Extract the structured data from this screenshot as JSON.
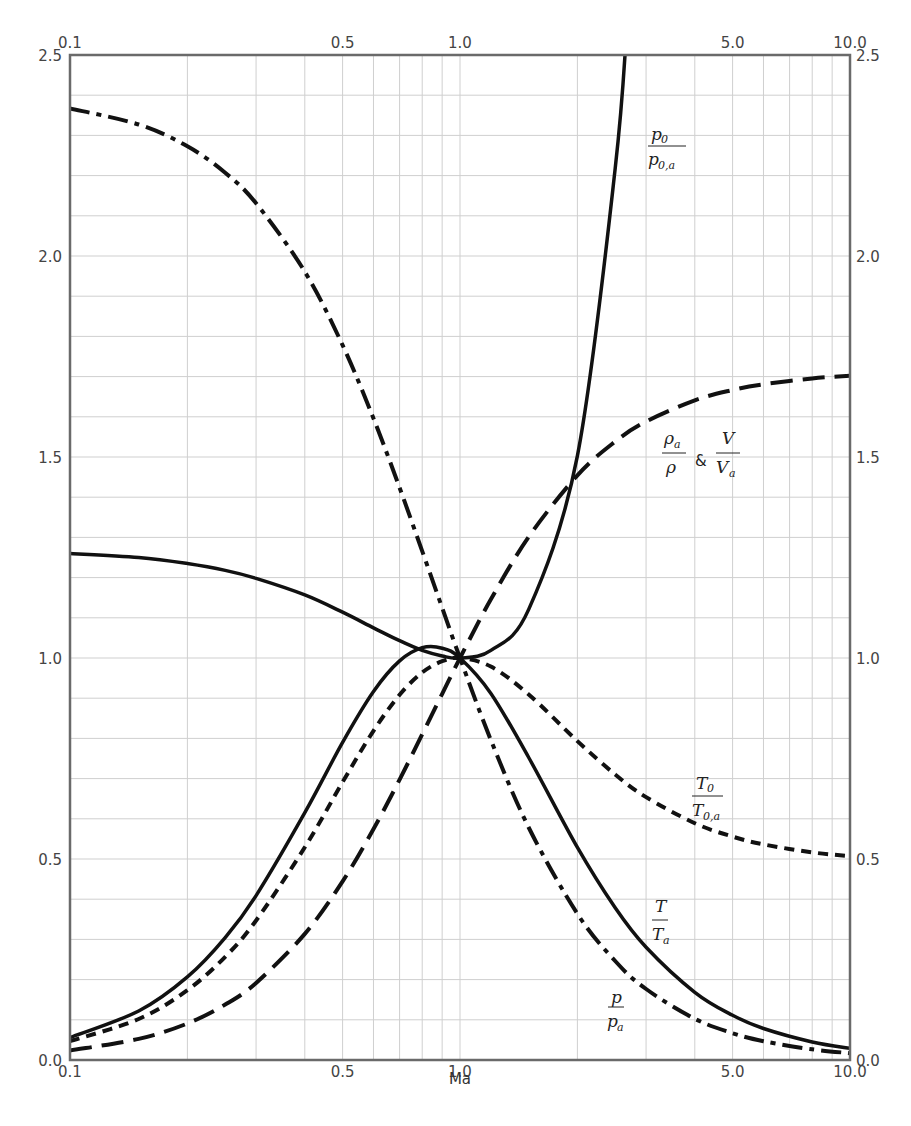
{
  "chart_data": {
    "type": "line",
    "title": "",
    "xlabel": "Ma",
    "ylabel": "",
    "xscale": "log",
    "xlim": [
      0.1,
      10.0
    ],
    "ylim": [
      0.0,
      2.5
    ],
    "grid": true,
    "legend": "inline curve labels",
    "x_ticks_bottom": [
      "0.1",
      "0.5",
      "1.0",
      "5.0",
      "10.0"
    ],
    "x_ticks_top": [
      "0.1",
      "0.5",
      "1.0",
      "5.0",
      "10.0"
    ],
    "y_ticks_left": [
      "0.0",
      "0.5",
      "1.0",
      "1.5",
      "2.0",
      "2.5"
    ],
    "y_ticks_right": [
      "0.0",
      "0.5",
      "1.0",
      "1.5",
      "2.0",
      "2.5"
    ],
    "x": [
      0.1,
      0.15,
      0.2,
      0.25,
      0.3,
      0.4,
      0.5,
      0.6,
      0.7,
      0.8,
      0.9,
      1.0,
      1.2,
      1.5,
      2.0,
      2.5,
      3.0,
      4.0,
      5.0,
      6.0,
      8.0,
      10.0
    ],
    "series": [
      {
        "name": "p0/p0,a",
        "style": "solid",
        "label": {
          "num": "p",
          "num_sub": "0",
          "den": "p",
          "den_sub": "0,a",
          "amp": false
        },
        "values": [
          1.26,
          1.25,
          1.235,
          1.218,
          1.198,
          1.157,
          1.114,
          1.075,
          1.043,
          1.019,
          1.005,
          1.0,
          1.019,
          1.121,
          1.503,
          2.218,
          null,
          null,
          null,
          null,
          null,
          null
        ]
      },
      {
        "name": "rho_a/rho & V/V_a",
        "style": "longdash",
        "label": {
          "num": "ρ",
          "num_sub": "a",
          "den": "ρ",
          "den_sub": "",
          "amp": true,
          "num2": "V",
          "den2": "V",
          "den2_sub": "a"
        },
        "values": [
          0.0237,
          0.0524,
          0.0909,
          0.1379,
          0.1918,
          0.3137,
          0.4444,
          0.5745,
          0.6975,
          0.8101,
          0.9109,
          1.0,
          1.1459,
          1.3012,
          1.4545,
          1.5385,
          1.5882,
          1.641,
          1.6667,
          1.6809,
          1.6954,
          1.7021
        ]
      },
      {
        "name": "T0/T0,a",
        "style": "shortdash",
        "label": {
          "num": "T",
          "num_sub": "0",
          "den": "T",
          "den_sub": "0,a",
          "amp": false
        },
        "values": [
          0.0468,
          0.102,
          0.1736,
          0.2568,
          0.3469,
          0.529,
          0.6914,
          0.8189,
          0.9085,
          0.9639,
          0.9921,
          1.0,
          0.9787,
          0.9093,
          0.7934,
          0.7101,
          0.654,
          0.5891,
          0.5556,
          0.5363,
          0.5165,
          0.507
        ]
      },
      {
        "name": "T/T_a",
        "style": "solid",
        "label": {
          "num": "T",
          "num_sub": "",
          "den": "T",
          "den_sub": "a",
          "amp": false
        },
        "values": [
          0.056,
          0.1218,
          0.2066,
          0.3044,
          0.4089,
          0.6151,
          0.7901,
          0.9167,
          0.9929,
          1.0255,
          1.0245,
          1.0,
          0.9119,
          0.7525,
          0.5289,
          0.3787,
          0.2803,
          0.1683,
          0.1111,
          0.0784,
          0.0449,
          0.029
        ]
      },
      {
        "name": "p/p_a",
        "style": "dashdot",
        "label": {
          "num": "p",
          "num_sub": "",
          "den": "p",
          "den_sub": "a",
          "amp": false
        },
        "values": [
          2.367,
          2.327,
          2.273,
          2.207,
          2.131,
          1.961,
          1.778,
          1.596,
          1.4235,
          1.2658,
          1.1246,
          1.0,
          0.7958,
          0.5783,
          0.3636,
          0.2462,
          0.1765,
          0.1026,
          0.0667,
          0.0467,
          0.0265,
          0.017
        ]
      }
    ]
  },
  "labels": {
    "x_axis": "Ma",
    "p0": {
      "num": "p",
      "num_sub": "0",
      "den": "p",
      "den_sub": "0,a"
    },
    "rho": {
      "num": "ρ",
      "num_sub": "a",
      "den": "ρ",
      "amp": "&",
      "num2": "V",
      "den2": "V",
      "den2_sub": "a"
    },
    "T0": {
      "num": "T",
      "num_sub": "0",
      "den": "T",
      "den_sub": "0,a"
    },
    "T": {
      "num": "T",
      "den": "T",
      "den_sub": "a"
    },
    "p": {
      "num": "p",
      "den": "p",
      "den_sub": "a"
    }
  }
}
